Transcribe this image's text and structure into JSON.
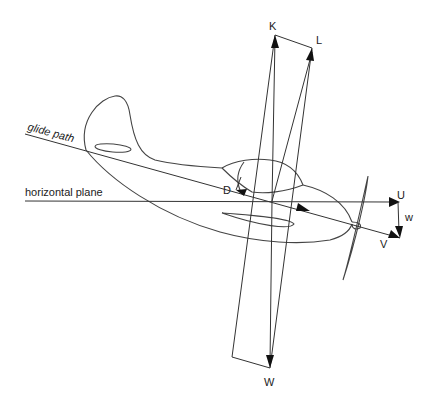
{
  "diagram": {
    "labels": {
      "glide_path": "glide path",
      "horizontal_plane": "horizontal plane",
      "K": "K",
      "L": "L",
      "D": "D",
      "U": "U",
      "w": "w",
      "V": "V",
      "W": "W"
    },
    "vectors": [
      {
        "name": "K",
        "meaning": "resultant aerodynamic force (vertical)"
      },
      {
        "name": "L",
        "meaning": "lift"
      },
      {
        "name": "D",
        "meaning": "drag"
      },
      {
        "name": "W",
        "meaning": "weight"
      },
      {
        "name": "V",
        "meaning": "velocity along glide path"
      },
      {
        "name": "U",
        "meaning": "horizontal velocity component"
      },
      {
        "name": "w",
        "meaning": "vertical (sink) velocity component"
      }
    ]
  }
}
